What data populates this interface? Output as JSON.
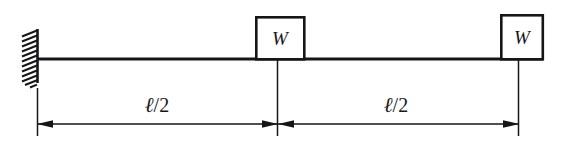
{
  "figure": {
    "type": "structural-beam-diagram",
    "background_color": "#ffffff",
    "line_color": "#16161a"
  },
  "support": {
    "kind": "fixed-support",
    "label": "",
    "hatch_count": 12
  },
  "beam": {
    "label": "",
    "start_x": 37,
    "end_x": 543,
    "y": 59
  },
  "loads": [
    {
      "label": "W",
      "name": "load-block-center",
      "box": {
        "x": 255,
        "y": 16,
        "width": 50,
        "height": 43
      }
    },
    {
      "label": "W",
      "name": "load-block-right",
      "box": {
        "x": 500,
        "y": 14,
        "width": 43,
        "height": 45
      }
    }
  ],
  "dimensions": [
    {
      "label": "ℓ/2",
      "symbol": "ℓ",
      "fraction": "/2",
      "from_x": 37,
      "to_x": 277,
      "label_x": 157,
      "name": "dimension-left-half-span"
    },
    {
      "label": "ℓ/2",
      "symbol": "ℓ",
      "fraction": "/2",
      "from_x": 277,
      "to_x": 518,
      "label_x": 396,
      "name": "dimension-right-half-span"
    }
  ],
  "dimension_line": {
    "y": 124,
    "label_baseline_y": 112
  },
  "extension_lines": [
    {
      "x": 37,
      "top_y": 88,
      "bottom_y": 136,
      "name": "extension-line-left"
    },
    {
      "x": 277,
      "top_y": 60,
      "bottom_y": 136,
      "name": "extension-line-center"
    },
    {
      "x": 518,
      "top_y": 60,
      "bottom_y": 136,
      "name": "extension-line-right"
    }
  ]
}
